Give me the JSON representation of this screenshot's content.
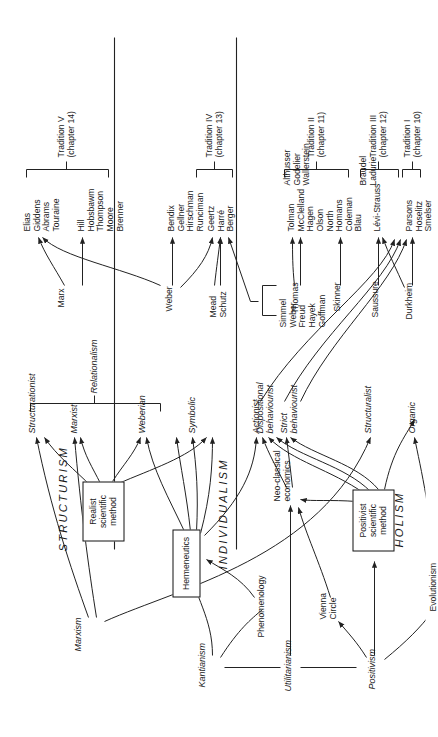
{
  "figure": {
    "orientation_note": "page-rotated",
    "line_color": "#222222",
    "text_color": "#1a1a1a"
  },
  "philosophies": [
    {
      "id": "kantianism",
      "label": "Kantianism"
    },
    {
      "id": "utilitarianism",
      "label": "Utilitarianism"
    },
    {
      "id": "positivism",
      "label": "Positivism"
    }
  ],
  "intermediate_nodes": [
    {
      "id": "phenomenology",
      "label": "Phenomenology"
    },
    {
      "id": "vienna_circle",
      "label": "Vienna\nCircle"
    },
    {
      "id": "neo_classical",
      "label": "Neo-classical\neconomics"
    },
    {
      "id": "evolutionism",
      "label": "Evolutionism"
    },
    {
      "id": "marxism",
      "label": "Marxism"
    }
  ],
  "method_boxes": [
    {
      "id": "hermeneutics",
      "label": "Hermeneutics"
    },
    {
      "id": "realist_method",
      "label": "Realist\nscientific\nmethod"
    },
    {
      "id": "positivist_method",
      "label": "Positivist\nscientific\nmethod"
    }
  ],
  "paradigms": [
    {
      "id": "structurism",
      "label": "STRUCTURISM"
    },
    {
      "id": "individualism",
      "label": "INDIVIDUALISM"
    },
    {
      "id": "holism",
      "label": "HOLISM"
    }
  ],
  "brackets": [
    {
      "id": "relationalism",
      "label": "Relationalism"
    }
  ],
  "approaches": [
    {
      "id": "structurationist",
      "label": "Structurationist"
    },
    {
      "id": "marxist",
      "label": "Marxist"
    },
    {
      "id": "weberian",
      "label": "Weberian"
    },
    {
      "id": "symbolic",
      "label": "Symbolic"
    },
    {
      "id": "actionist",
      "label": "Actionist"
    },
    {
      "id": "dispositional",
      "label": "Dispositional\nbehaviourist"
    },
    {
      "id": "strict",
      "label": "Strict\nbehaviourist"
    },
    {
      "id": "structuralist",
      "label": "Structuralist"
    },
    {
      "id": "organic",
      "label": "Organic"
    }
  ],
  "founders": [
    {
      "id": "marx",
      "label": "Marx"
    },
    {
      "id": "weber",
      "label": "Weber"
    },
    {
      "id": "mead_schutz",
      "label": "Mead\nSchutz"
    },
    {
      "id": "simmel_group",
      "label": "Simmel\nWeber\nFreud\nHayek\nGoffman"
    },
    {
      "id": "thomas",
      "label": "Thomas"
    },
    {
      "id": "skinner",
      "label": "Skinner"
    },
    {
      "id": "saussure",
      "label": "Saussure"
    },
    {
      "id": "durkheim",
      "label": "Durkheim"
    }
  ],
  "scholar_groups": [
    {
      "id": "elias",
      "label": "Elias\nGiddens\nAbrams\nTouraine"
    },
    {
      "id": "hill",
      "label": "Hill\nHobsbawm\nThompson\nMoore\nBrenner"
    },
    {
      "id": "bendix",
      "label": "Bendix\nGellner\nHirschman\nRunciman"
    },
    {
      "id": "geertz",
      "label": "Geertz\nHarré\nBerger"
    },
    {
      "id": "tolman",
      "label": "Tolman\nMcClelland\nHagen\nOlson\nNorth"
    },
    {
      "id": "homans",
      "label": "Homans\nColeman\nBlau"
    },
    {
      "id": "levi_strauss",
      "label": "Lévi-Strauss"
    },
    {
      "id": "althusser",
      "label": "Althusser\nGodelier\nWallerstein"
    },
    {
      "id": "braudel",
      "label": "Braudel\nLadurie"
    },
    {
      "id": "parsons",
      "label": "Parsons\nHoselitz\nSmelser"
    }
  ],
  "traditions": [
    {
      "id": "t5",
      "label": "Tradition V\n(chapter 14)"
    },
    {
      "id": "t4",
      "label": "Tradition IV\n(chapter 13)"
    },
    {
      "id": "t2",
      "label": "Tradition II\n(chapter 11)"
    },
    {
      "id": "t3",
      "label": "Tradition III\n(chapter 12)"
    },
    {
      "id": "t1",
      "label": "Tradition I\n(chapter 10)"
    }
  ]
}
